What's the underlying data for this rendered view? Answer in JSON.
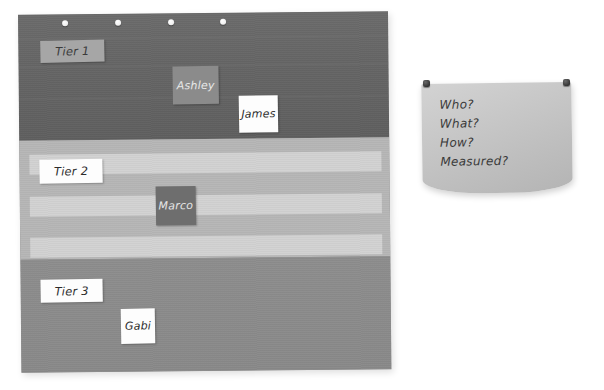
{
  "scene": {
    "title": "Tiered board with pinned notes",
    "background_color": "#ffffff"
  },
  "board": {
    "name": "tiered-chart-board",
    "pins": [
      {
        "name": "board-pin-1"
      },
      {
        "name": "board-pin-2"
      },
      {
        "name": "board-pin-3"
      },
      {
        "name": "board-pin-4"
      }
    ],
    "tiers": [
      {
        "id": "tier1",
        "label": "Tier 1",
        "label_note_style": "gray-light",
        "band_color": "#656565",
        "notes": [
          {
            "label": "Ashley",
            "style": "gray-mid"
          },
          {
            "label": "James",
            "style": "white"
          }
        ]
      },
      {
        "id": "tier2",
        "label": "Tier 2",
        "label_note_style": "white",
        "band_color": "#b6b6b6",
        "stripe_color": "#d2d2d2",
        "stripe_count": 3,
        "notes": [
          {
            "label": "Marco",
            "style": "gray-dark"
          }
        ]
      },
      {
        "id": "tier3",
        "label": "Tier 3",
        "label_note_style": "white",
        "band_color": "#8d8d8d",
        "notes": [
          {
            "label": "Gabi",
            "style": "white"
          }
        ]
      }
    ]
  },
  "paper_note": {
    "name": "questions-paper-note",
    "paper_color": "#c8c8c8",
    "pin_color": "#333333",
    "lines": [
      "Who?",
      "What?",
      "How?",
      "Measured?"
    ]
  }
}
